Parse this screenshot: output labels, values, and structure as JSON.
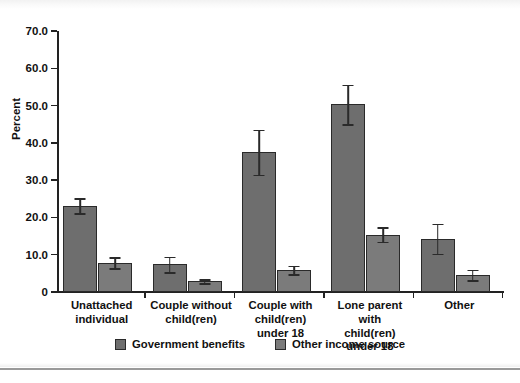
{
  "chart_data": {
    "type": "bar",
    "title": "",
    "xlabel": "",
    "ylabel": "Percent",
    "ylim": [
      0,
      70
    ],
    "ytick_labels": [
      "0",
      "10.0",
      "20.0",
      "30.0",
      "40.0",
      "50.0",
      "60.0",
      "70.0"
    ],
    "yticks": [
      0,
      10,
      20,
      30,
      40,
      50,
      60,
      70
    ],
    "grid": false,
    "legend_position": "bottom-center",
    "categories": [
      "Unattached individual",
      "Couple without child(ren)",
      "Couple with child(ren) under 18",
      "Lone parent with child(ren) under 18",
      "Other"
    ],
    "category_label_lines": [
      [
        "Unattached",
        "individual"
      ],
      [
        "Couple without",
        "child(ren)"
      ],
      [
        "Couple with",
        "child(ren)",
        "under 18"
      ],
      [
        "Lone parent with",
        "child(ren)",
        "under 18"
      ],
      [
        "Other"
      ]
    ],
    "series": [
      {
        "name": "Government benefits",
        "color": "#6e6e6e",
        "values": [
          23.2,
          7.4,
          37.5,
          50.3,
          14.3
        ],
        "errors": [
          2.0,
          2.1,
          6.0,
          5.3,
          4.0
        ]
      },
      {
        "name": "Other income source",
        "color": "#7b7b7b",
        "values": [
          7.9,
          2.9,
          5.9,
          15.4,
          4.6
        ],
        "errors": [
          1.5,
          0.5,
          1.1,
          1.9,
          1.4
        ]
      }
    ]
  }
}
